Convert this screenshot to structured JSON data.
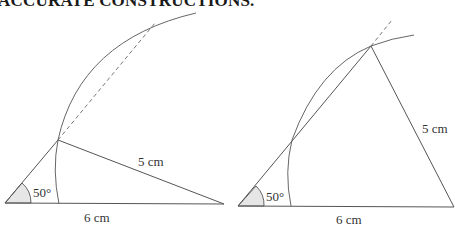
{
  "heading": "ACCURATE CONSTRUCTIONS.",
  "figures": [
    {
      "name": "left-construction",
      "angle_label": "50°",
      "base_label": "6 cm",
      "side_label": "5 cm"
    },
    {
      "name": "right-construction",
      "angle_label": "50°",
      "base_label": "6 cm",
      "side_label": "5 cm"
    }
  ],
  "colors": {
    "line": "#555555",
    "arc": "#666666",
    "angle_fill": "#e6e6e6"
  }
}
